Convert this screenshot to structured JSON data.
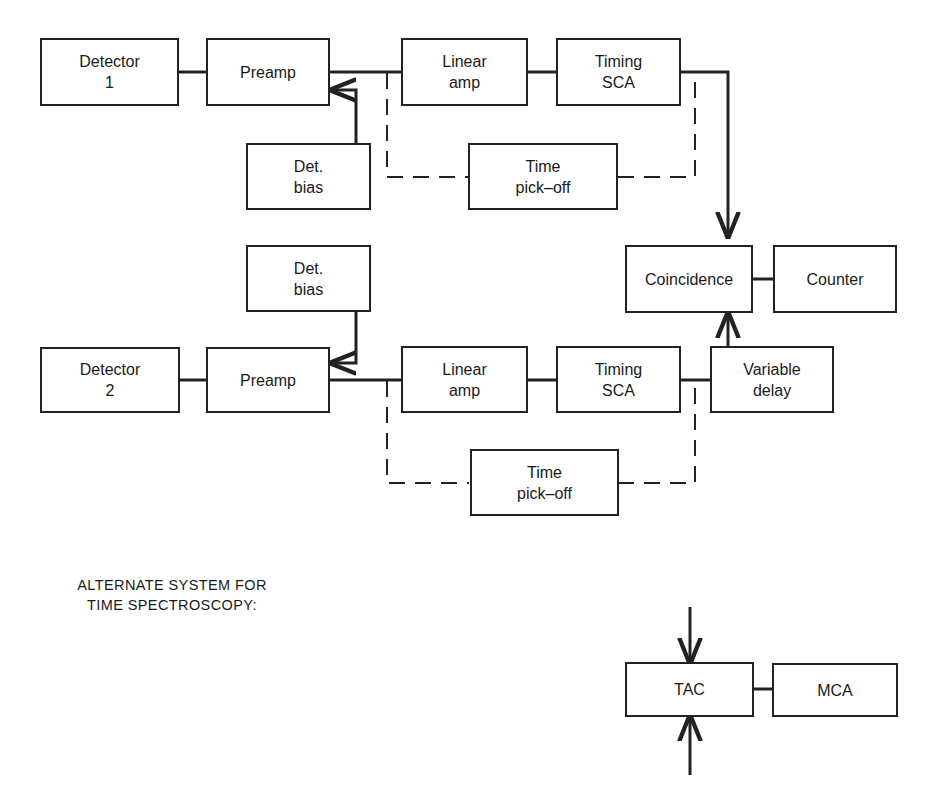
{
  "diagram": {
    "type": "block-diagram",
    "colors": {
      "line": "#222222",
      "background": "#ffffff"
    },
    "boxes": {
      "detector1": [
        "Detector",
        "1"
      ],
      "preamp1": [
        "Preamp"
      ],
      "bias1": [
        "Det.",
        "bias"
      ],
      "linamp1": [
        "Linear",
        "amp"
      ],
      "sca1": [
        "Timing",
        "SCA"
      ],
      "pickoff1": [
        "Time",
        "pick–off"
      ],
      "coincidence": [
        "Coincidence"
      ],
      "counter": [
        "Counter"
      ],
      "bias2": [
        "Det.",
        "bias"
      ],
      "detector2": [
        "Detector",
        "2"
      ],
      "preamp2": [
        "Preamp"
      ],
      "linamp2": [
        "Linear",
        "amp"
      ],
      "sca2": [
        "Timing",
        "SCA"
      ],
      "delay": [
        "Variable",
        "delay"
      ],
      "pickoff2": [
        "Time",
        "pick–off"
      ],
      "tac": [
        "TAC"
      ],
      "mca": [
        "MCA"
      ]
    },
    "caption": [
      "ALTERNATE SYSTEM FOR",
      "TIME SPECTROSCOPY:"
    ],
    "connections": [
      {
        "from": "Detector 1",
        "to": "Preamp",
        "style": "solid"
      },
      {
        "from": "Det. bias",
        "to": "Preamp",
        "style": "arrow"
      },
      {
        "from": "Preamp",
        "to": "Linear amp",
        "style": "solid"
      },
      {
        "from": "Linear amp",
        "to": "Timing SCA",
        "style": "solid"
      },
      {
        "from": "Timing SCA",
        "to": "Coincidence",
        "style": "arrow"
      },
      {
        "from": "Preamp",
        "to": "Time pick-off",
        "style": "dashed"
      },
      {
        "from": "Time pick-off",
        "to": "Timing SCA output",
        "style": "dashed"
      },
      {
        "from": "Coincidence",
        "to": "Counter",
        "style": "solid"
      },
      {
        "from": "Det. bias",
        "to": "Preamp",
        "style": "arrow"
      },
      {
        "from": "Detector 2",
        "to": "Preamp",
        "style": "solid"
      },
      {
        "from": "Preamp",
        "to": "Linear amp",
        "style": "solid"
      },
      {
        "from": "Linear amp",
        "to": "Timing SCA",
        "style": "solid"
      },
      {
        "from": "Timing SCA",
        "to": "Variable delay",
        "style": "solid"
      },
      {
        "from": "Variable delay",
        "to": "Coincidence",
        "style": "arrow"
      },
      {
        "from": "Preamp",
        "to": "Time pick-off",
        "style": "dashed"
      },
      {
        "from": "Time pick-off",
        "to": "Timing SCA output",
        "style": "dashed"
      },
      {
        "from": "input",
        "to": "TAC",
        "style": "arrow"
      },
      {
        "from": "input",
        "to": "TAC",
        "style": "arrow"
      },
      {
        "from": "TAC",
        "to": "MCA",
        "style": "solid"
      }
    ]
  }
}
